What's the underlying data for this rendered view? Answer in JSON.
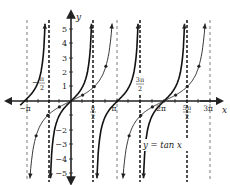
{
  "chart_data": {
    "type": "line",
    "title": "",
    "xlabel": "x",
    "ylabel": "y",
    "xlim": [
      -3.5,
      9.8
    ],
    "ylim": [
      -5.5,
      5.5
    ],
    "grid": false,
    "x_tick_labels": [
      "−π",
      "−π/2",
      "π/2",
      "π",
      "3π/2",
      "2π",
      "5π/2",
      "3π"
    ],
    "y_tick_labels": [
      "−5",
      "−4",
      "−3",
      "−2",
      "−1",
      "1",
      "2",
      "3",
      "4",
      "5"
    ],
    "series": [
      {
        "name": "y = tan x",
        "style": "bold",
        "function": "tan(x)",
        "asymptotes": [
          "−π/2",
          "π/2",
          "3π/2",
          "5π/2"
        ]
      },
      {
        "name": "y = tan(x/2)",
        "style": "thin with marked points",
        "function": "tan(x/2)",
        "asymptotes": [
          "−π",
          "π",
          "3π"
        ],
        "points": [
          {
            "x": "−π/2",
            "y": -1
          },
          {
            "x": "−π/4",
            "y": -0.41
          },
          {
            "x": "π/4",
            "y": 0.41
          },
          {
            "x": "π/2",
            "y": 1
          },
          {
            "x": "−π/2 − π/4",
            "y": -2.41
          },
          {
            "x": "3π/4",
            "y": 2.41
          }
        ]
      }
    ],
    "annotations": [
      "y = tan x"
    ]
  },
  "labels": {
    "x_axis": "x",
    "y_axis": "y",
    "curve_label": "y = tan x",
    "neg_pi": "−π",
    "neg_half_pi_num": "π",
    "neg_half_pi_den": "2",
    "half_pi_num": "π",
    "half_pi_den": "2",
    "pi": "π",
    "three_half_pi_num": "3π",
    "three_half_pi_den": "2",
    "two_pi": "2π",
    "five_half_pi_num": "5π",
    "five_half_pi_den": "2",
    "three_pi": "3π",
    "y_ticks": [
      "5",
      "4",
      "3",
      "2",
      "1",
      "−2",
      "−3",
      "−4",
      "−5"
    ]
  }
}
